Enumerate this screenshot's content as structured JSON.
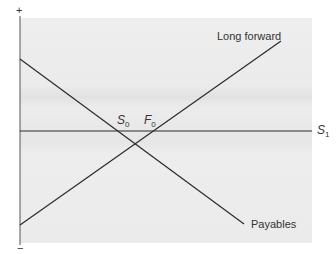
{
  "diagram": {
    "type": "payoff-diagram",
    "axis": {
      "top_sign": "+",
      "bottom_sign": "−",
      "x_label": "S",
      "x_label_sub": "1"
    },
    "lines": [
      {
        "name": "Long forward",
        "label": "Long forward"
      },
      {
        "name": "Payables",
        "label": "Payables"
      }
    ],
    "points": [
      {
        "label": "S",
        "sub": "0"
      },
      {
        "label": "F",
        "sub": "0"
      }
    ],
    "colors": {
      "plot_bg": "#ececec",
      "line": "#2b2b2b",
      "text": "#333333"
    }
  }
}
